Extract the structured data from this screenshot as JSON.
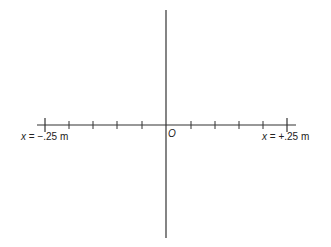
{
  "diagram": {
    "type": "coordinate-axes",
    "origin_label": "O",
    "left_label": {
      "var": "x",
      "text": " = −.25 m"
    },
    "right_label": {
      "var": "x",
      "text": " = +.25 m"
    },
    "x_range_m": [
      -0.25,
      0.25
    ],
    "tick_count_each_side": 5,
    "tick_spacing_m": 0.05,
    "colors": {
      "axis": "#333333",
      "text": "#222222",
      "background": "#ffffff"
    }
  }
}
